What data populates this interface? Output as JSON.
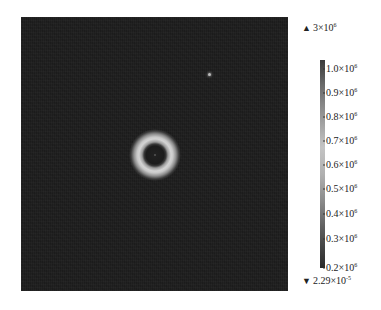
{
  "image": {
    "description": "Grayscale intensity map with a single bright ring (annulus) near the center on a dark noisy background, with a colorbar on the right",
    "ring": {
      "center_px": [
        155,
        155
      ],
      "inner_dark_radius_px": 11,
      "peak_radius_px": 17,
      "outer_radius_px": 24
    },
    "bright_spot_px": [
      209,
      74
    ]
  },
  "colorbar": {
    "max_marker": {
      "symbol": "▲",
      "mantissa": "3×10",
      "exponent": "6"
    },
    "min_marker": {
      "symbol": "▼",
      "mantissa": "2.29×10",
      "exponent": "-5"
    },
    "ticks": [
      {
        "mantissa": "1.0×10",
        "exponent": "6"
      },
      {
        "mantissa": "0.9×10",
        "exponent": "6"
      },
      {
        "mantissa": "0.8×10",
        "exponent": "6"
      },
      {
        "mantissa": "0.7×10",
        "exponent": "6"
      },
      {
        "mantissa": "0.6×10",
        "exponent": "6"
      },
      {
        "mantissa": "0.5×10",
        "exponent": "6"
      },
      {
        "mantissa": "0.4×10",
        "exponent": "6"
      },
      {
        "mantissa": "0.3×10",
        "exponent": "6"
      },
      {
        "mantissa": "0.2×10",
        "exponent": "6"
      }
    ]
  }
}
